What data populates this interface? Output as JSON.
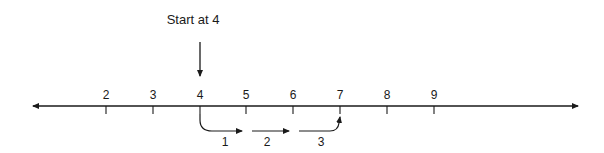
{
  "diagram": {
    "type": "number-line",
    "annotation": "Start at 4",
    "start_value": 4,
    "end_value": 7,
    "ticks": [
      {
        "value": "2",
        "x": 106
      },
      {
        "value": "3",
        "x": 153
      },
      {
        "value": "4",
        "x": 200
      },
      {
        "value": "5",
        "x": 246
      },
      {
        "value": "6",
        "x": 293
      },
      {
        "value": "7",
        "x": 340
      },
      {
        "value": "8",
        "x": 387
      },
      {
        "value": "9",
        "x": 434
      }
    ],
    "hops": [
      {
        "label": "1",
        "from": "4",
        "to": "5"
      },
      {
        "label": "2",
        "from": "5",
        "to": "6"
      },
      {
        "label": "3",
        "from": "6",
        "to": "7"
      }
    ],
    "colors": {
      "line": "#1a1a1a",
      "background": "#ffffff"
    }
  }
}
